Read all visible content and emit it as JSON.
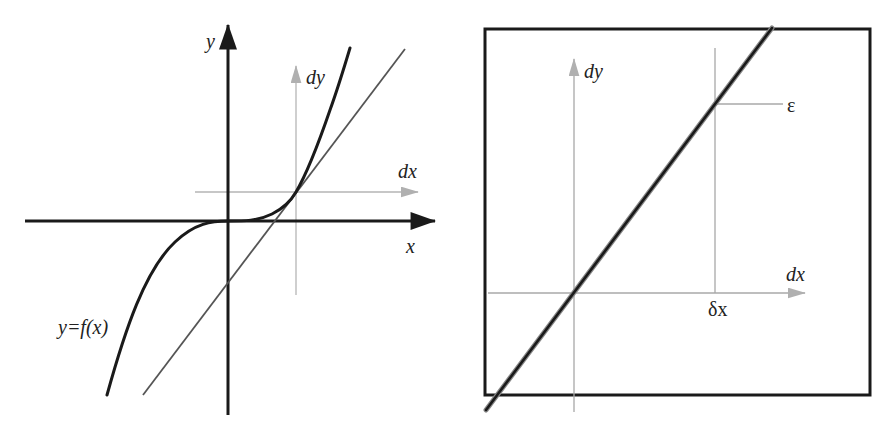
{
  "colors": {
    "ink": "#1a1a1a",
    "grey_axis": "#a8a8a8",
    "tangent": "#555555",
    "background": "#ffffff"
  },
  "left_panel": {
    "description": "Graph of y=f(x) (cubic-like curve) with tangent line at a point and local dx/dy axes",
    "labels": {
      "y_axis": "y",
      "x_axis": "x",
      "dy": "dy",
      "dx": "dx",
      "curve": "y=f(x)"
    }
  },
  "right_panel": {
    "description": "Zoomed-in view (framed box) showing the curve approximately straight in local dx/dy coordinates",
    "labels": {
      "dy": "dy",
      "dx": "dx",
      "delta_x": "δx",
      "epsilon": "ε"
    }
  }
}
